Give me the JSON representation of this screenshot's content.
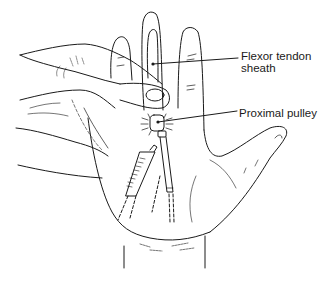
{
  "figure": {
    "line_color": "#1a1a1a",
    "background": "#ffffff"
  },
  "labels": {
    "flexor_tendon_sheath": "Flexor tendon\nsheath",
    "proximal_pulley": "Proximal pulley"
  }
}
